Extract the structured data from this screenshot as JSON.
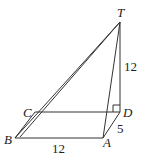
{
  "diagram": {
    "type": "3d-geometry-pyramid",
    "points": {
      "T": {
        "label": "T",
        "x": 120,
        "y": 22
      },
      "D": {
        "label": "D",
        "x": 120,
        "y": 112
      },
      "C": {
        "label": "C",
        "x": 35,
        "y": 112
      },
      "B": {
        "label": "B",
        "x": 15,
        "y": 138
      },
      "A": {
        "label": "A",
        "x": 103,
        "y": 138
      }
    },
    "segments": [
      [
        "B",
        "A"
      ],
      [
        "A",
        "D"
      ],
      [
        "D",
        "C"
      ],
      [
        "C",
        "B"
      ],
      [
        "T",
        "D"
      ],
      [
        "T",
        "A"
      ],
      [
        "T",
        "B"
      ],
      [
        "T",
        "C"
      ]
    ],
    "measurements": {
      "BA": "12",
      "TD": "12",
      "AD": "5"
    },
    "right_angle_at": "D",
    "line_color": "#333333"
  }
}
